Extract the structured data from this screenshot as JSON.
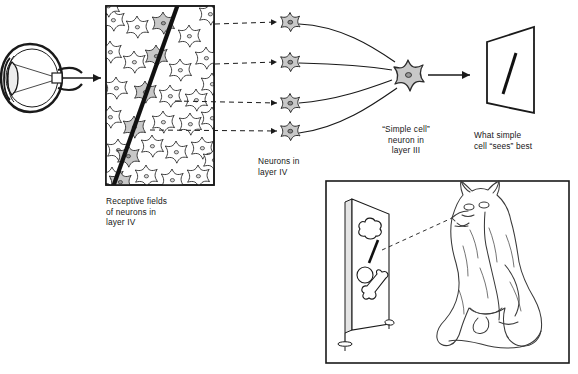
{
  "figure": {
    "background_color": "#ffffff",
    "ink_color": "#1a1a1a",
    "cell_fill_color": "#c8c8c8",
    "cell_outline_color": "#2b2b2b"
  },
  "labels": {
    "receptive_fields": "Receptive fields\nof neurons in\nlayer IV",
    "neurons_layer4": "Neurons in\nlayer IV",
    "simple_cell": "“Simple cell”\nneuron in\nlayer III",
    "what_sees_best": "What simple\ncell “sees” best"
  },
  "eye": {
    "name": "cat eye cross-section",
    "parts": [
      "sclera",
      "lens",
      "light rays",
      "receptive field patch",
      "optic nerve arrow"
    ]
  },
  "cortex_panel": {
    "name": "layer IV cortical sheet",
    "receptive_field_count": 32,
    "activated_cell_count": 6,
    "stimulus_bar": {
      "description": "oblique dark bar crossing the receptive field array",
      "angle_degrees": 72
    },
    "projection_arrows": 4
  },
  "layer4_neurons": {
    "count": 4,
    "shape": "stellate",
    "fill": "#c8c8c8"
  },
  "simple_cell": {
    "shape": "stellate",
    "fill": "#c8c8c8",
    "dendrite_count": 4,
    "axon_arrow": "arrow pointing right to receptive field screen"
  },
  "preferred_stimulus": {
    "shape": "trapezoid screen in perspective",
    "content": "single oblique bar",
    "bar_angle_degrees": 70
  },
  "cat_scene": {
    "border": true,
    "screen": {
      "description": "upright display screen on a stand",
      "shapes": [
        "cloud blob",
        "oblique bar",
        "circle",
        "bone blob"
      ]
    },
    "cat": {
      "description": "line drawing of a seated cat viewing the screen",
      "pose": "sitting, facing left"
    },
    "sight_line": "dashed line from cat's eye to the oblique bar on the screen"
  }
}
